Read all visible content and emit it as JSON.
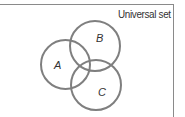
{
  "diagram": {
    "type": "venn",
    "universal_label": "Universal set",
    "sets": [
      {
        "label": "A",
        "cx": 65.5,
        "cy": 64.5,
        "r": 24.5
      },
      {
        "label": "B",
        "cx": 95,
        "cy": 46,
        "r": 25
      },
      {
        "label": "C",
        "cx": 96,
        "cy": 85,
        "r": 25
      }
    ],
    "colors": {
      "stroke": "#7f7f7f",
      "border": "#8a8a8a",
      "text": "#333333"
    }
  }
}
